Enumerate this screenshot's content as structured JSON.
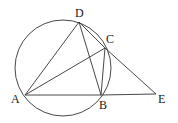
{
  "diagram": {
    "type": "geometry",
    "stroke_color": "#333333",
    "circle": {
      "cx": 63,
      "cy": 68,
      "r": 48
    },
    "points": [
      {
        "name": "A",
        "x": 25,
        "y": 95,
        "lx": 11,
        "ly": 103
      },
      {
        "name": "B",
        "x": 101,
        "y": 95,
        "lx": 99,
        "ly": 109
      },
      {
        "name": "C",
        "x": 105,
        "y": 48,
        "lx": 106,
        "ly": 43
      },
      {
        "name": "D",
        "x": 79,
        "y": 22,
        "lx": 75,
        "ly": 17
      },
      {
        "name": "E",
        "x": 156,
        "y": 94,
        "lx": 158,
        "ly": 103
      }
    ],
    "segments": [
      [
        "A",
        "D"
      ],
      [
        "A",
        "C"
      ],
      [
        "A",
        "B"
      ],
      [
        "B",
        "E"
      ],
      [
        "D",
        "B"
      ],
      [
        "D",
        "C"
      ],
      [
        "C",
        "E"
      ],
      [
        "C",
        "B"
      ]
    ]
  }
}
